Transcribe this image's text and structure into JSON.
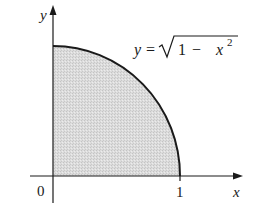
{
  "figure": {
    "axes": {
      "x_label": "x",
      "y_label": "y",
      "origin_label": "0",
      "x_tick_label": "1"
    },
    "curve": {
      "equation_lhs": "y",
      "equation_eq": "=",
      "equation_radicand_1": "1",
      "equation_minus": "−",
      "equation_var": "x",
      "equation_exp": "2"
    },
    "colors": {
      "axis": "#1a1a1a",
      "curve": "#1a1a1a",
      "fill": "#d9d9d9"
    }
  }
}
